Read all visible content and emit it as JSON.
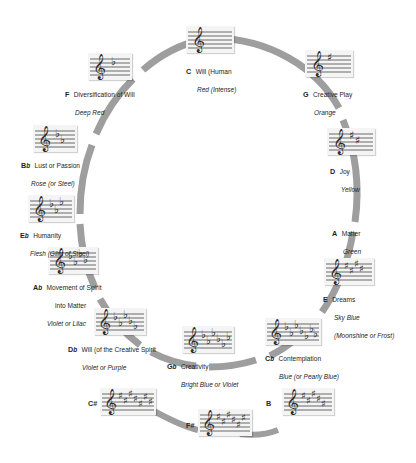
{
  "diagram": {
    "ring_color": "#9a9a9a",
    "staff_bg": "#f4f4f4",
    "text_color": "#1d1d1d"
  },
  "keys": [
    {
      "id": "C",
      "note": "C",
      "accidental": "",
      "quality": "Will (Human",
      "color_text": "Red (Intense)",
      "color_text2": "",
      "signature": "natural",
      "accidental_count": 0
    },
    {
      "id": "G",
      "note": "G",
      "accidental": "",
      "quality": "Creative Play",
      "color_text": "Orange",
      "color_text2": "",
      "signature": "sharp",
      "accidental_count": 1
    },
    {
      "id": "D",
      "note": "D",
      "accidental": "",
      "quality": "Joy",
      "color_text": "Yellow",
      "color_text2": "",
      "signature": "sharp",
      "accidental_count": 2
    },
    {
      "id": "A",
      "note": "A",
      "accidental": "",
      "quality": "Matter",
      "color_text": "Green",
      "color_text2": "",
      "signature": "none",
      "accidental_count": 3
    },
    {
      "id": "E",
      "note": "E",
      "accidental": "",
      "quality": "Dreams",
      "color_text": "Sky Blue",
      "color_text2": "(Moonshine or Frost)",
      "signature": "sharp",
      "accidental_count": 4
    },
    {
      "id": "Cb",
      "note": "C",
      "accidental": "b",
      "quality": "Contemplation",
      "color_text": "Blue (or Pearly Blue)",
      "color_text2": "",
      "signature": "flat",
      "accidental_count": 7
    },
    {
      "id": "Gb",
      "note": "G",
      "accidental": "b",
      "quality": "Creativity",
      "color_text": "Bright Blue or Violet",
      "color_text2": "",
      "signature": "flat",
      "accidental_count": 6
    },
    {
      "id": "Db",
      "note": "D",
      "accidental": "b",
      "quality": "Will (of the Creative Spirit",
      "color_text": "Violet or Purple",
      "color_text2": "",
      "signature": "flat",
      "accidental_count": 5
    },
    {
      "id": "Ab",
      "note": "A",
      "accidental": "b",
      "quality": "Movement of Spirit",
      "color_text": "into Matter",
      "color_text2": "Violet or Lilac",
      "signature": "flat",
      "accidental_count": 4
    },
    {
      "id": "Eb",
      "note": "E",
      "accidental": "b",
      "quality": "Humanity",
      "color_text": "Flesh (Glint of Steel)",
      "color_text2": "",
      "signature": "flat",
      "accidental_count": 3
    },
    {
      "id": "Bb",
      "note": "B",
      "accidental": "b",
      "quality": "Lust or Passion",
      "color_text": "Rose (or Steel)",
      "color_text2": "",
      "signature": "flat",
      "accidental_count": 2
    },
    {
      "id": "F",
      "note": "F",
      "accidental": "",
      "quality": "Diversification of Will",
      "color_text": "Deep Red",
      "color_text2": "",
      "signature": "flat",
      "accidental_count": 1
    }
  ],
  "bottom_row": [
    {
      "id": "Csharp",
      "note": "C",
      "accidental": "#",
      "signature": "sharp",
      "accidental_count": 7
    },
    {
      "id": "Fsharp",
      "note": "F",
      "accidental": "#",
      "signature": "sharp",
      "accidental_count": 6
    },
    {
      "id": "B",
      "note": "B",
      "accidental": "",
      "signature": "sharp",
      "accidental_count": 5
    }
  ]
}
